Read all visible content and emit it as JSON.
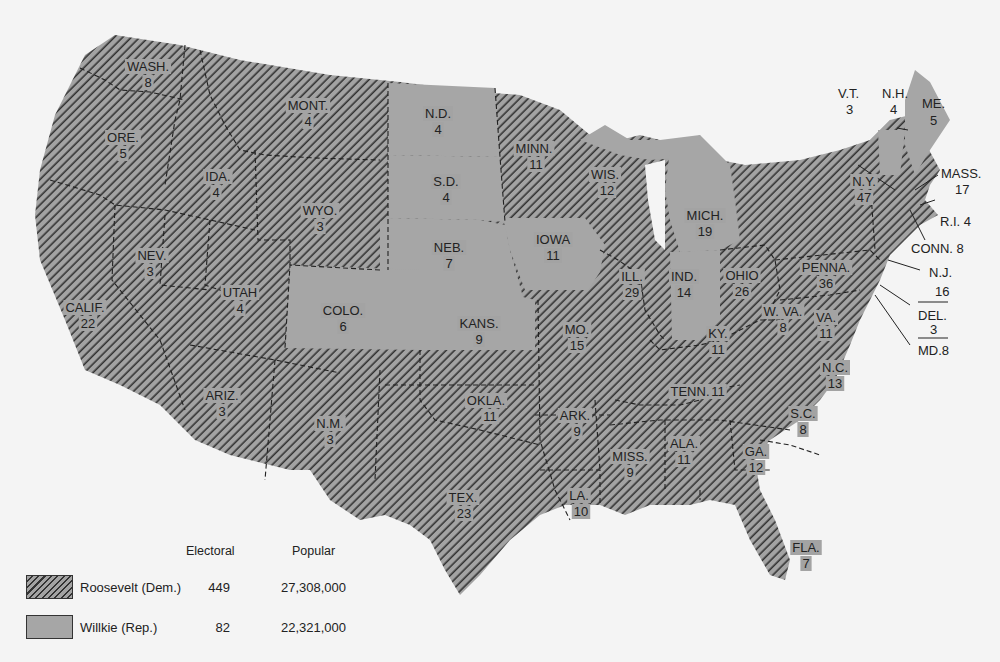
{
  "map": {
    "title": "1940 Presidential Election",
    "colors": {
      "background": "#f4f4f4",
      "roosevelt_fill": "#a3a3a3",
      "roosevelt_hatch": "#333333",
      "willkie_fill": "#a6a6a6",
      "border": "#222222"
    },
    "states": [
      {
        "abbr": "WASH.",
        "votes": "8",
        "winner": "Roosevelt"
      },
      {
        "abbr": "ORE.",
        "votes": "5",
        "winner": "Roosevelt"
      },
      {
        "abbr": "CALIF.",
        "votes": "22",
        "winner": "Roosevelt"
      },
      {
        "abbr": "IDA.",
        "votes": "4",
        "winner": "Roosevelt"
      },
      {
        "abbr": "NEV.",
        "votes": "3",
        "winner": "Roosevelt"
      },
      {
        "abbr": "MONT.",
        "votes": "4",
        "winner": "Roosevelt"
      },
      {
        "abbr": "WYO.",
        "votes": "3",
        "winner": "Roosevelt"
      },
      {
        "abbr": "UTAH",
        "votes": "4",
        "winner": "Roosevelt"
      },
      {
        "abbr": "ARIZ.",
        "votes": "3",
        "winner": "Roosevelt"
      },
      {
        "abbr": "COLO.",
        "votes": "6",
        "winner": "Willkie"
      },
      {
        "abbr": "N.M.",
        "votes": "3",
        "winner": "Roosevelt"
      },
      {
        "abbr": "N.D.",
        "votes": "4",
        "winner": "Willkie"
      },
      {
        "abbr": "S.D.",
        "votes": "4",
        "winner": "Willkie"
      },
      {
        "abbr": "NEB.",
        "votes": "7",
        "winner": "Willkie"
      },
      {
        "abbr": "KANS.",
        "votes": "9",
        "winner": "Willkie"
      },
      {
        "abbr": "OKLA.",
        "votes": "11",
        "winner": "Roosevelt"
      },
      {
        "abbr": "TEX.",
        "votes": "23",
        "winner": "Roosevelt"
      },
      {
        "abbr": "MINN.",
        "votes": "11",
        "winner": "Roosevelt"
      },
      {
        "abbr": "IOWA",
        "votes": "11",
        "winner": "Willkie"
      },
      {
        "abbr": "MO.",
        "votes": "15",
        "winner": "Roosevelt"
      },
      {
        "abbr": "ARK.",
        "votes": "9",
        "winner": "Roosevelt"
      },
      {
        "abbr": "LA.",
        "votes": "10",
        "winner": "Roosevelt"
      },
      {
        "abbr": "WIS.",
        "votes": "12",
        "winner": "Roosevelt"
      },
      {
        "abbr": "ILL.",
        "votes": "29",
        "winner": "Roosevelt"
      },
      {
        "abbr": "MICH.",
        "votes": "19",
        "winner": "Willkie"
      },
      {
        "abbr": "IND.",
        "votes": "14",
        "winner": "Willkie"
      },
      {
        "abbr": "OHIO",
        "votes": "26",
        "winner": "Roosevelt"
      },
      {
        "abbr": "KY.",
        "votes": "11",
        "winner": "Roosevelt"
      },
      {
        "abbr": "TENN.",
        "votes": "11",
        "winner": "Roosevelt"
      },
      {
        "abbr": "MISS.",
        "votes": "9",
        "winner": "Roosevelt"
      },
      {
        "abbr": "ALA.",
        "votes": "11",
        "winner": "Roosevelt"
      },
      {
        "abbr": "GA.",
        "votes": "12",
        "winner": "Roosevelt"
      },
      {
        "abbr": "FLA.",
        "votes": "7",
        "winner": "Roosevelt"
      },
      {
        "abbr": "S.C.",
        "votes": "8",
        "winner": "Roosevelt"
      },
      {
        "abbr": "N.C.",
        "votes": "13",
        "winner": "Roosevelt"
      },
      {
        "abbr": "VA.",
        "votes": "11",
        "winner": "Roosevelt"
      },
      {
        "abbr": "W. VA.",
        "votes": "8",
        "winner": "Roosevelt"
      },
      {
        "abbr": "PENNA.",
        "votes": "36",
        "winner": "Roosevelt"
      },
      {
        "abbr": "N.Y.",
        "votes": "47",
        "winner": "Roosevelt"
      },
      {
        "abbr": "V.T.",
        "votes": "3",
        "winner": "Willkie"
      },
      {
        "abbr": "N.H.",
        "votes": "4",
        "winner": "Roosevelt"
      },
      {
        "abbr": "ME.",
        "votes": "5",
        "winner": "Willkie"
      },
      {
        "abbr": "MASS.",
        "votes": "17",
        "winner": "Roosevelt"
      },
      {
        "abbr": "R.I.",
        "votes": "4",
        "winner": "Roosevelt"
      },
      {
        "abbr": "CONN.",
        "votes": "8",
        "winner": "Roosevelt"
      },
      {
        "abbr": "N.J.",
        "votes": "16",
        "winner": "Roosevelt"
      },
      {
        "abbr": "DEL.",
        "votes": "3",
        "winner": "Roosevelt"
      },
      {
        "abbr": "MD.",
        "votes": "8",
        "winner": "Roosevelt"
      }
    ],
    "external_labels": {
      "vt": "V.T.",
      "vt_votes": "3",
      "nh": "N.H.",
      "nh_votes": "4",
      "me": "ME.",
      "me_votes": "5",
      "mass": "MASS.",
      "mass_votes": "17",
      "ri": "R.I.  4",
      "conn": "CONN.  8",
      "nj": "N.J.",
      "nj_votes": "16",
      "del": "DEL.",
      "del_votes": "3",
      "md": "MD.8"
    }
  },
  "legend": {
    "col_electoral": "Electoral",
    "col_popular": "Popular",
    "entries": [
      {
        "candidate": "Roosevelt (Dem.)",
        "electoral": "449",
        "popular": "27,308,000",
        "pattern": "hatched"
      },
      {
        "candidate": "Willkie (Rep.)",
        "electoral": "82",
        "popular": "22,321,000",
        "pattern": "solid"
      }
    ]
  }
}
